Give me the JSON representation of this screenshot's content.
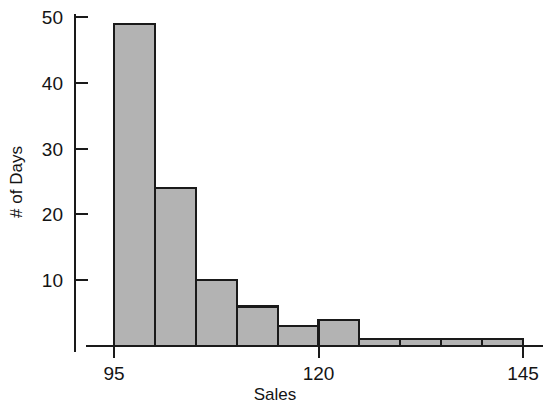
{
  "chart_data": {
    "type": "bar",
    "title": "",
    "subtitle": "",
    "xlabel": "Sales",
    "ylabel": "# of Days",
    "bin_width": 5,
    "bin_edges": [
      95,
      100,
      105,
      110,
      115,
      120,
      125,
      130,
      135,
      140,
      145
    ],
    "categories": [
      "95-100",
      "100-105",
      "105-110",
      "110-115",
      "115-120",
      "120-125",
      "125-130",
      "130-135",
      "135-140",
      "140-145"
    ],
    "values": [
      49,
      24,
      10,
      6,
      3,
      4,
      1,
      1,
      1,
      1
    ],
    "xlim": [
      90,
      148
    ],
    "ylim": [
      0,
      52
    ],
    "x_ticks": [
      95,
      120,
      145
    ],
    "x_tick_labels": [
      "95",
      "120",
      "145"
    ],
    "y_ticks": [
      10,
      20,
      30,
      40,
      50
    ],
    "y_tick_labels": [
      "10",
      "20",
      "30",
      "40",
      "50"
    ],
    "grid": false,
    "legend": false,
    "legend_position": "none",
    "bar_fill_color": "#b3b3b3",
    "bar_edge_color": "#1a1a1a",
    "axis_color": "#1a1a1a",
    "background_color": "#ffffff"
  }
}
